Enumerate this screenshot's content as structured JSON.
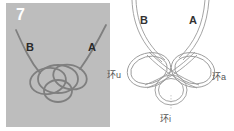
{
  "step": {
    "number": "7"
  },
  "photo": {
    "label_left": "B",
    "label_right": "A",
    "background": "#bdbdbd",
    "cord_color": "#7a7a7a"
  },
  "diagram": {
    "label_left": "B",
    "label_right": "A",
    "loops": {
      "left": "环u",
      "right": "环a",
      "bottom": "环i"
    },
    "stroke_color": "#9a9a9a"
  }
}
